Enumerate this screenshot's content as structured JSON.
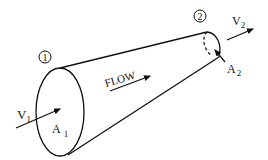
{
  "diagram": {
    "type": "converging-nozzle-flow",
    "labels": {
      "section1": "1",
      "section2": "2",
      "flow": "FLOW",
      "v1_main": "V",
      "v1_sub": "1",
      "v2_main": "V",
      "v2_sub": "2",
      "a1_main": "A",
      "a1_sub": "1",
      "a2_main": "A",
      "a2_sub": "2"
    },
    "colors": {
      "stroke": "#111111",
      "background": "#ffffff"
    }
  }
}
